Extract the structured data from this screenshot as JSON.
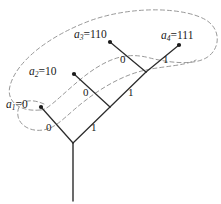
{
  "figure": {
    "type": "binary-code-tree-diagram",
    "background_color": "#ffffff",
    "stroke_color": "#2b2b2b",
    "dashed_curve_color": "#8c8c8c"
  },
  "leaves": [
    {
      "id": "a1",
      "name": "a",
      "subscript": "1",
      "equals": "=",
      "value": "0",
      "label_text": "a₁=0",
      "dot": {
        "x": 41,
        "y": 107
      },
      "label_pos": {
        "x": 6,
        "y": 99
      }
    },
    {
      "id": "a2",
      "name": "a",
      "subscript": "2",
      "equals": "=",
      "value": "10",
      "label_text": "a₂=10",
      "dot": {
        "x": 74,
        "y": 74
      },
      "label_pos": {
        "x": 29,
        "y": 66
      }
    },
    {
      "id": "a3",
      "name": "a",
      "subscript": "3",
      "equals": "=",
      "value": "110",
      "label_text": "a₃=110",
      "dot": {
        "x": 110,
        "y": 42
      },
      "label_pos": {
        "x": 74,
        "y": 29
      }
    },
    {
      "id": "a4",
      "name": "a",
      "subscript": "4",
      "equals": "=",
      "value": "111",
      "label_text": "a₄=111",
      "dot": {
        "x": 179,
        "y": 45
      },
      "label_pos": {
        "x": 161,
        "y": 30
      }
    }
  ],
  "nodes": {
    "root": {
      "x": 73,
      "y": 143
    },
    "internal_1": {
      "x": 110,
      "y": 107
    },
    "internal_2": {
      "x": 146,
      "y": 72
    },
    "trunk_bottom": {
      "x": 73,
      "y": 201
    }
  },
  "edges": [
    {
      "id": "root-to-a1",
      "from": "root",
      "to": "a1",
      "bit": "0"
    },
    {
      "id": "root-to-internal1",
      "from": "root",
      "to": "internal_1",
      "bit": "1"
    },
    {
      "id": "internal1-to-a2",
      "from": "internal_1",
      "to": "a2",
      "bit": "0"
    },
    {
      "id": "internal1-to-internal2",
      "from": "internal_1",
      "to": "internal_2",
      "bit": "1"
    },
    {
      "id": "internal2-to-a3",
      "from": "internal_2",
      "to": "a3",
      "bit": "0"
    },
    {
      "id": "internal2-to-a4",
      "from": "internal_2",
      "to": "a4",
      "bit": "1"
    }
  ],
  "edge_labels": [
    {
      "id": "bit-root-left",
      "text": "0",
      "x": 46,
      "y": 122
    },
    {
      "id": "bit-root-right",
      "text": "1",
      "x": 91,
      "y": 122
    },
    {
      "id": "bit-l1-left",
      "text": "0",
      "x": 83,
      "y": 87
    },
    {
      "id": "bit-l1-right",
      "text": "1",
      "x": 128,
      "y": 87
    },
    {
      "id": "bit-l2-left",
      "text": "0",
      "x": 120,
      "y": 54
    },
    {
      "id": "bit-l2-right",
      "text": "1",
      "x": 163,
      "y": 54
    }
  ],
  "set_curves": [
    {
      "id": "outer-set-curve",
      "description": "large dashed loop enclosing all four leaf nodes",
      "path": "M 40 110 C 18 112 6 100 10 86 C 16 62 48 36 92 20 C 136 5 186 8 206 20 C 222 30 220 50 206 58 C 192 66 166 62 150 58 C 128 52 112 58 96 68 C 80 78 62 96 52 104 C 47 108 44 110 40 110 Z"
    },
    {
      "id": "inner-set-curve",
      "description": "smaller dashed loop enclosing a1 and curving up to the right",
      "path": "M 44 104 C 26 96 16 104 18 116 C 20 128 36 134 50 128 C 60 124 70 112 86 100 C 104 86 126 74 146 70 C 164 66 184 66 196 60"
    }
  ]
}
